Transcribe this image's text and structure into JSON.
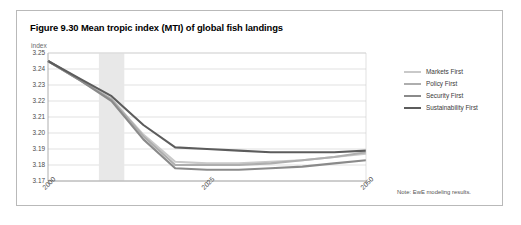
{
  "figure": {
    "title": "Figure 9.30 Mean tropic index (MTI) of global fish landings",
    "note": "Note: EwE modeling results.",
    "axis_unit": "index",
    "border_color": "#b9b9b9",
    "background": "#ffffff"
  },
  "legend": {
    "position": "right",
    "items": [
      {
        "label": "Markets First",
        "color": "#c9c9c9"
      },
      {
        "label": "Policy First",
        "color": "#aeaeae"
      },
      {
        "label": "Security First",
        "color": "#8a8a8a"
      },
      {
        "label": "Sustainability First",
        "color": "#5c5c5c"
      }
    ]
  },
  "chart_data": {
    "type": "line",
    "title": "Figure 9.30 Mean tropic index (MTI) of global fish landings",
    "subtitle": "",
    "xlabel": "",
    "ylabel": "index",
    "xlim": [
      2000,
      2050
    ],
    "ylim": [
      3.17,
      3.25
    ],
    "ytick_values": [
      3.25,
      3.24,
      3.23,
      3.22,
      3.21,
      3.2,
      3.19,
      3.18,
      3.17
    ],
    "ytick_labels": [
      "3.25",
      "3.24",
      "3.23",
      "3.22",
      "3.21",
      "3.20",
      "3.19",
      "3.18",
      "3.17"
    ],
    "xtick_values": [
      2000,
      2025,
      2050
    ],
    "xtick_labels": [
      "2000",
      "2025",
      "2050"
    ],
    "grid": true,
    "grid_axis": "y",
    "shaded_band": {
      "x_start": 2008,
      "x_end": 2012,
      "color": "#e8e8e8"
    },
    "x": [
      2000,
      2005,
      2010,
      2015,
      2020,
      2025,
      2030,
      2035,
      2040,
      2045,
      2050
    ],
    "series": [
      {
        "name": "Markets First",
        "color": "#c9c9c9",
        "values": [
          3.245,
          3.233,
          3.221,
          3.199,
          3.182,
          3.181,
          3.181,
          3.182,
          3.183,
          3.185,
          3.187
        ]
      },
      {
        "name": "Policy First",
        "color": "#aeaeae",
        "values": [
          3.245,
          3.233,
          3.221,
          3.198,
          3.18,
          3.18,
          3.18,
          3.181,
          3.183,
          3.185,
          3.188
        ]
      },
      {
        "name": "Security First",
        "color": "#8a8a8a",
        "values": [
          3.245,
          3.233,
          3.22,
          3.196,
          3.178,
          3.177,
          3.177,
          3.178,
          3.179,
          3.181,
          3.183
        ]
      },
      {
        "name": "Sustainability First",
        "color": "#5c5c5c",
        "values": [
          3.245,
          3.234,
          3.223,
          3.205,
          3.191,
          3.19,
          3.189,
          3.188,
          3.188,
          3.188,
          3.189
        ]
      }
    ],
    "note": "Note: EwE modeling results."
  }
}
